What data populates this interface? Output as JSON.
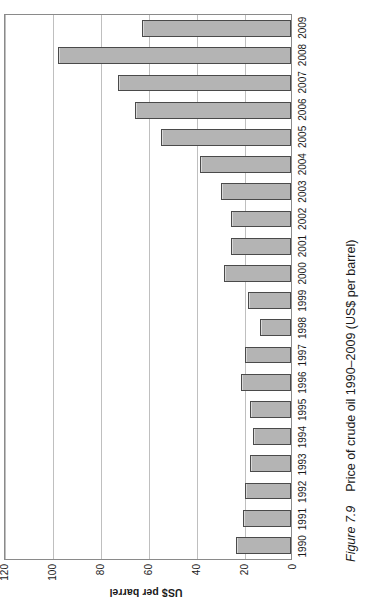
{
  "figure": {
    "number_label": "Figure 7.9",
    "caption_text": "Price of crude oil 1990–2009 (US$ per barrel)"
  },
  "chart_data": {
    "type": "bar",
    "title": "Price of crude oil 1990–2009 (US$ per barrel)",
    "xlabel": "",
    "ylabel": "US$ per barrel",
    "ylim": [
      0,
      120
    ],
    "ytick_labels": [
      "0",
      "20",
      "40",
      "60",
      "80",
      "100",
      "120"
    ],
    "ytick_values": [
      0,
      20,
      40,
      60,
      80,
      100,
      120
    ],
    "grid": true,
    "legend": "none",
    "orientation": "vertical-bars-printed-sideways",
    "bar_fill_color": "#b4b4b4",
    "bar_border_color": "#4a4a4a",
    "categories": [
      "1990",
      "1991",
      "1992",
      "1993",
      "1994",
      "1995",
      "1996",
      "1997",
      "1998",
      "1999",
      "2000",
      "2001",
      "2002",
      "2003",
      "2004",
      "2005",
      "2006",
      "2007",
      "2008",
      "2009"
    ],
    "values": [
      23,
      20,
      19,
      17,
      16,
      17,
      21,
      19,
      13,
      18,
      28,
      25,
      25,
      29,
      38,
      54,
      65,
      72,
      97,
      62
    ]
  }
}
